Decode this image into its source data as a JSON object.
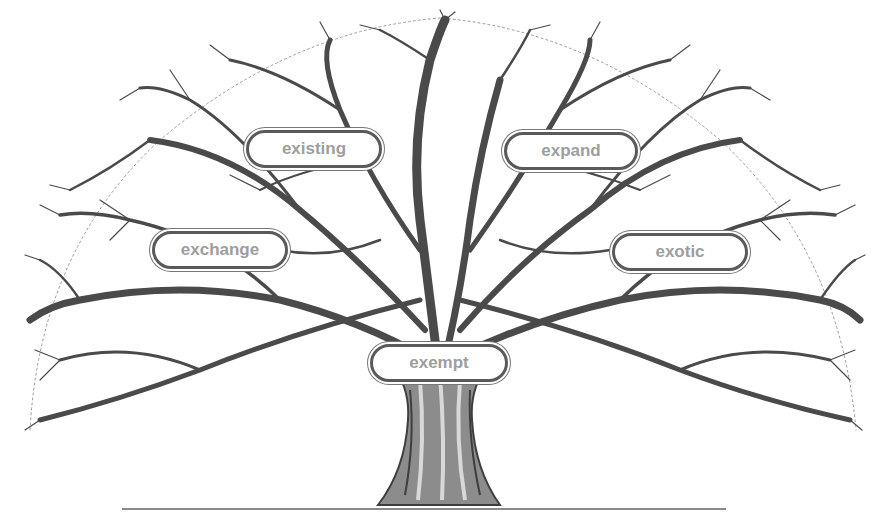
{
  "diagram": {
    "type": "word-tree",
    "root_prefix": "ex",
    "labels": [
      {
        "id": "existing",
        "text": "existing",
        "x": 246,
        "y": 130,
        "w": 136,
        "h": 38
      },
      {
        "id": "expand",
        "text": "expand",
        "x": 504,
        "y": 132,
        "w": 134,
        "h": 38
      },
      {
        "id": "exchange",
        "text": "exchange",
        "x": 152,
        "y": 231,
        "w": 136,
        "h": 38
      },
      {
        "id": "exotic",
        "text": "exotic",
        "x": 612,
        "y": 233,
        "w": 136,
        "h": 38
      },
      {
        "id": "exempt",
        "text": "exempt",
        "x": 370,
        "y": 344,
        "w": 138,
        "h": 38
      }
    ],
    "colors": {
      "branch": "#4a4a4a",
      "label_text": "#9e9e9e",
      "label_border": "#5a5a5a",
      "background": "#ffffff",
      "ground_line": "#8a8a8a"
    }
  }
}
